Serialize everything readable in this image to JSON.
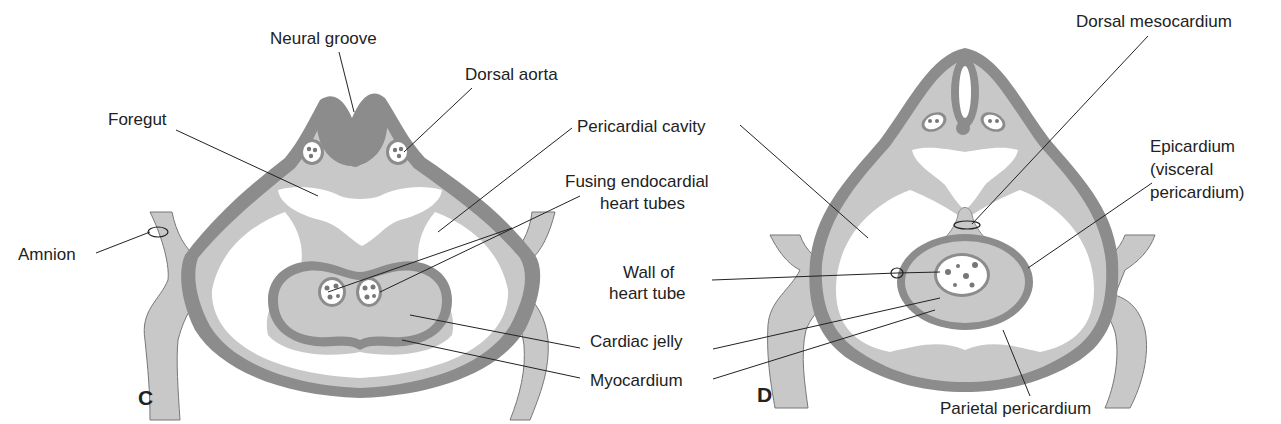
{
  "figure": {
    "panel_c": {
      "letter": "C",
      "labels": {
        "neural_groove": "Neural groove",
        "dorsal_aorta": "Dorsal aorta",
        "foregut": "Foregut",
        "pericardial_cavity": "Pericardial cavity",
        "fusing_1": "Fusing endocardial",
        "fusing_2": "heart tubes",
        "amnion": "Amnion",
        "cardiac_jelly": "Cardiac jelly",
        "myocardium": "Myocardium"
      }
    },
    "panel_d": {
      "letter": "D",
      "labels": {
        "dorsal_mesocardium": "Dorsal mesocardium",
        "epicardium_1": "Epicardium",
        "epicardium_2": "(visceral",
        "epicardium_3": "pericardium)",
        "wall_1": "Wall of",
        "wall_2": "heart tube",
        "parietal_pericardium": "Parietal pericardium"
      }
    },
    "colors": {
      "dark_tissue": "#8c8c8c",
      "light_tissue": "#c8c8c8",
      "pale_tissue": "#dcdcdc",
      "line": "#222222",
      "background": "#ffffff"
    }
  }
}
